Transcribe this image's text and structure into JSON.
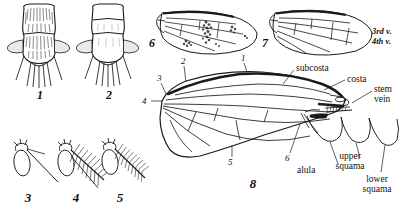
{
  "plate": {
    "background_color": "#ffffff",
    "ink_color": "#1a1a1a",
    "description": "Entomological line-art plate of fly morphology: thorax dorsal views, antennae, and wings"
  },
  "figures": [
    {
      "id": "fig1",
      "number": "1",
      "subject": "thorax-dorsal-hairy"
    },
    {
      "id": "fig2",
      "number": "2",
      "subject": "thorax-dorsal-bare"
    },
    {
      "id": "fig3",
      "number": "3",
      "subject": "antenna-bare-arista"
    },
    {
      "id": "fig4",
      "number": "4",
      "subject": "antenna-plumose-arista"
    },
    {
      "id": "fig5",
      "number": "5",
      "subject": "antenna-pubescent-arista"
    },
    {
      "id": "fig6",
      "number": "6",
      "subject": "wing-spotted"
    },
    {
      "id": "fig7",
      "number": "7",
      "subject": "wing-clear-veined"
    },
    {
      "id": "fig8",
      "number": "8",
      "subject": "wing-labelled-diagram"
    }
  ],
  "fig7_labels": [
    {
      "text": "3rd v.",
      "name": "third-vein-label"
    },
    {
      "text": "4th v.",
      "name": "fourth-vein-label"
    }
  ],
  "fig8": {
    "callout_numbers": [
      "1",
      "2",
      "3",
      "4",
      "5",
      "6"
    ],
    "labels": [
      {
        "text": "subcosta",
        "name": "subcosta-label"
      },
      {
        "text": "costa",
        "name": "costa-label"
      },
      {
        "text": "stem",
        "name": "stem-vein-label-line1"
      },
      {
        "text": "vein",
        "name": "stem-vein-label-line2"
      },
      {
        "text": "alula",
        "name": "alula-label"
      },
      {
        "text": "upper",
        "name": "upper-squama-label-line1"
      },
      {
        "text": "squama",
        "name": "upper-squama-label-line2"
      },
      {
        "text": "lower",
        "name": "lower-squama-label-line1"
      },
      {
        "text": "squama",
        "name": "lower-squama-label-line2"
      }
    ]
  }
}
